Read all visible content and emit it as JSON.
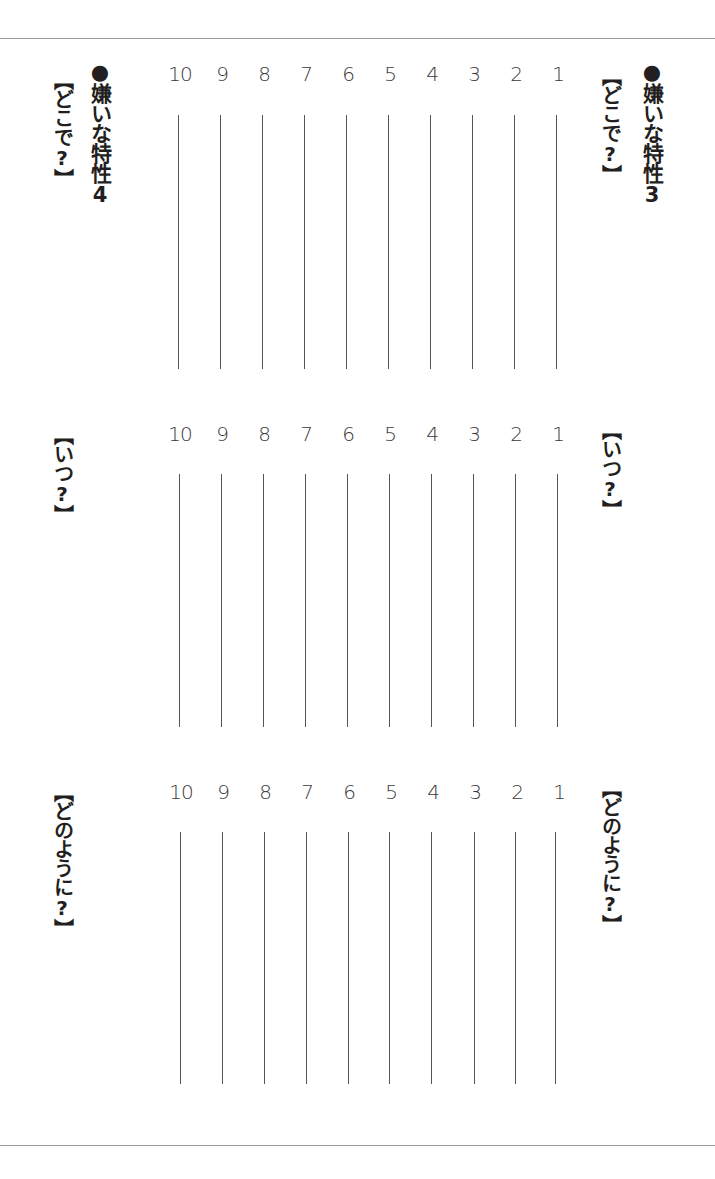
{
  "page": {
    "background": "#ffffff",
    "rule_color": "#9a9a9a",
    "line_color": "#555555"
  },
  "columns": {
    "right": {
      "title": "●嫌いな特性3",
      "labels": [
        "【どこで?】",
        "【いつ?】",
        "【どのように?】"
      ]
    },
    "left": {
      "title": "●嫌いな特性4",
      "labels": [
        "【どこで?】",
        "【いつ?】",
        "【どのように?】"
      ]
    }
  },
  "sections": [
    {
      "name": "where",
      "numbers": [
        "10",
        "9",
        "8",
        "7",
        "6",
        "5",
        "4",
        "3",
        "2",
        "1"
      ]
    },
    {
      "name": "when",
      "numbers": [
        "10",
        "9",
        "8",
        "7",
        "6",
        "5",
        "4",
        "3",
        "2",
        "1"
      ]
    },
    {
      "name": "how",
      "numbers": [
        "10",
        "9",
        "8",
        "7",
        "6",
        "5",
        "4",
        "3",
        "2",
        "1"
      ]
    }
  ]
}
